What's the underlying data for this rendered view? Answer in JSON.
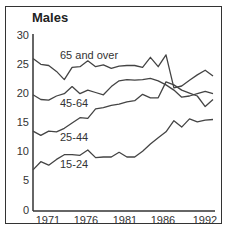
{
  "chart_data": {
    "type": "line",
    "title": "Males",
    "xlabel": "",
    "ylabel": "",
    "ylim": [
      0,
      30
    ],
    "xlim": [
      1970,
      1993
    ],
    "yticks": [
      0,
      5,
      10,
      15,
      20,
      25,
      30
    ],
    "xtick_labels": [
      "1971",
      "1976",
      "1981",
      "1986",
      "1992"
    ],
    "grid": false,
    "legend": "inline labels",
    "x": [
      1970,
      1971,
      1972,
      1973,
      1974,
      1975,
      1976,
      1977,
      1978,
      1979,
      1980,
      1981,
      1982,
      1983,
      1984,
      1985,
      1986,
      1987,
      1988,
      1989,
      1990,
      1991,
      1992,
      1993
    ],
    "series": [
      {
        "name": "65 and over",
        "values": [
          26,
          25,
          24.8,
          23.8,
          22.4,
          24.5,
          24.6,
          25.6,
          24.6,
          24.9,
          24.3,
          24.7,
          24.8,
          24.8,
          24.5,
          26.2,
          24.6,
          26.6,
          21.0,
          21.3,
          22.3,
          23.2,
          24.0,
          23.0
        ]
      },
      {
        "name": "45-64",
        "values": [
          19.8,
          19.0,
          18.9,
          19.6,
          20.0,
          21.2,
          20.0,
          20.6,
          20.2,
          19.8,
          21.2,
          22.2,
          22.4,
          22.3,
          22.4,
          22.6,
          22.2,
          21.5,
          20.6,
          19.4,
          19.6,
          20.0,
          20.4,
          20.0
        ]
      },
      {
        "name": "25-44",
        "values": [
          13.6,
          12.9,
          13.6,
          13.5,
          14.1,
          15.0,
          15.9,
          15.8,
          17.4,
          17.6,
          18.0,
          18.2,
          18.6,
          18.8,
          19.9,
          19.3,
          19.3,
          22.0,
          21.5,
          20.6,
          20.1,
          19.6,
          17.8,
          19.0
        ]
      },
      {
        "name": "15-24",
        "values": [
          7.0,
          8.4,
          7.8,
          8.8,
          9.6,
          9.6,
          9.5,
          10.4,
          9.1,
          9.2,
          9.2,
          10.0,
          9.2,
          9.2,
          10.2,
          11.4,
          12.5,
          13.5,
          15.4,
          14.3,
          15.7,
          15.2,
          15.5,
          15.6
        ]
      }
    ]
  },
  "labels": {
    "title": "Males",
    "y_ticks": [
      "30",
      "25",
      "20",
      "15",
      "10",
      "5",
      "0"
    ],
    "x_ticks": [
      "1971",
      "1976",
      "1981",
      "1986",
      "1992"
    ],
    "series_labels": [
      "65 and over",
      "45-64",
      "25-44",
      "15-24"
    ]
  }
}
